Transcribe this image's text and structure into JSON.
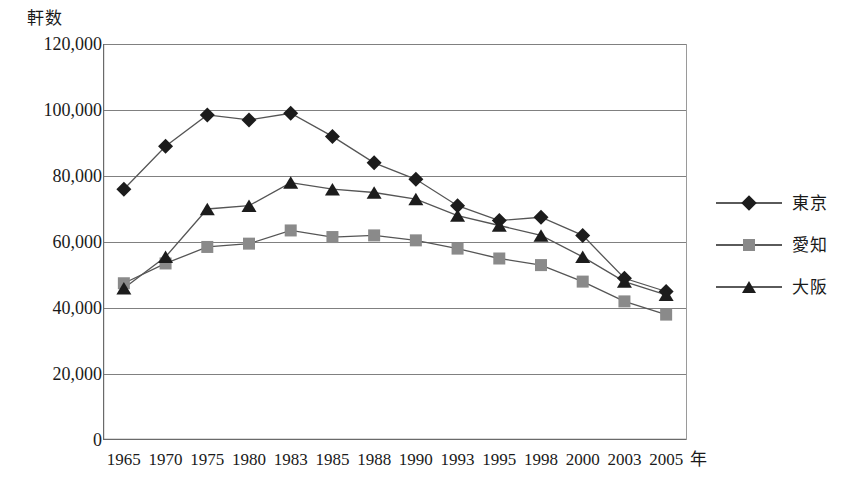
{
  "chart_data": {
    "type": "line",
    "title": "",
    "subtitle": "",
    "xlabel": "年",
    "ylabel": "軒数",
    "ylim": [
      0,
      120000
    ],
    "yticks": [
      0,
      20000,
      40000,
      60000,
      80000,
      100000,
      120000
    ],
    "ytick_labels": [
      "0",
      "20,000",
      "40,000",
      "60,000",
      "80,000",
      "100,000",
      "120,000"
    ],
    "categories": [
      "1965",
      "1970",
      "1975",
      "1980",
      "1983",
      "1985",
      "1988",
      "1990",
      "1993",
      "1995",
      "1998",
      "2000",
      "2003",
      "2005"
    ],
    "grid": "horizontal",
    "legend_position": "right",
    "series": [
      {
        "name": "東京",
        "marker": "diamond",
        "color": "#1c1c1c",
        "values": [
          76000,
          89000,
          98500,
          97000,
          99000,
          92000,
          84000,
          79000,
          71000,
          66500,
          67500,
          62000,
          49000,
          45000
        ]
      },
      {
        "name": "愛知",
        "marker": "square",
        "color": "#8a8a8a",
        "values": [
          47500,
          53500,
          58500,
          59500,
          63500,
          61500,
          62000,
          60500,
          58000,
          55000,
          53000,
          48000,
          42000,
          38000
        ]
      },
      {
        "name": "大阪",
        "marker": "triangle",
        "color": "#1c1c1c",
        "values": [
          46000,
          55500,
          70000,
          71000,
          78000,
          76000,
          75000,
          73000,
          68000,
          65000,
          62000,
          55500,
          48000,
          44000
        ]
      }
    ]
  },
  "axis": {
    "y_title": "軒数",
    "x_unit": "年"
  },
  "legend": {
    "items": [
      {
        "label": "東京"
      },
      {
        "label": "愛知"
      },
      {
        "label": "大阪"
      }
    ]
  }
}
